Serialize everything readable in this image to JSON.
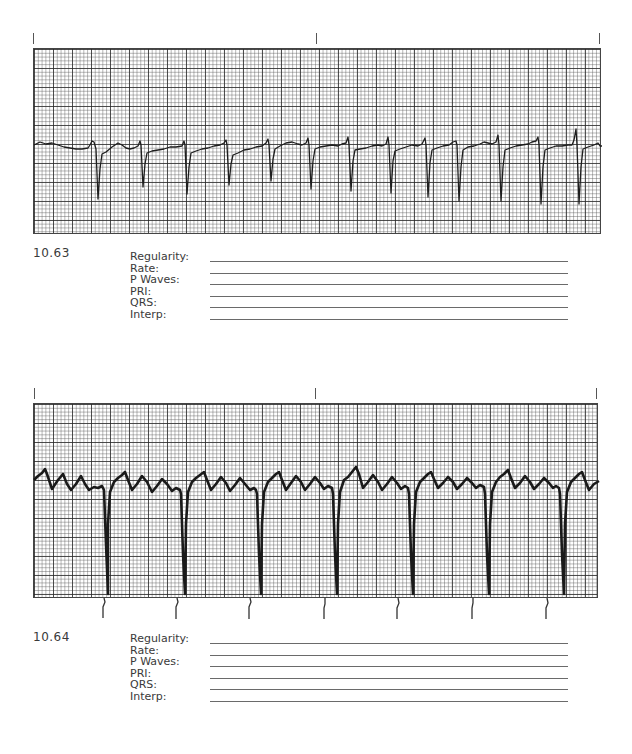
{
  "page": {
    "background": "#ffffff",
    "ink": "#3a3a3a"
  },
  "figures": [
    {
      "number": "10.63",
      "strip": {
        "description": "ECG rhythm strip on grid paper with negative (downward) QRS complexes",
        "top_ticks": 3,
        "qrs_count": 14
      },
      "fields": [
        {
          "label": "Regularity:",
          "value": ""
        },
        {
          "label": "Rate:",
          "value": ""
        },
        {
          "label": "P Waves:",
          "value": ""
        },
        {
          "label": "PRI:",
          "value": ""
        },
        {
          "label": "QRS:",
          "value": ""
        },
        {
          "label": "Interp:",
          "value": ""
        }
      ]
    },
    {
      "number": "10.64",
      "strip": {
        "description": "ECG rhythm strip with sawtooth flutter waves and regular deep negative QRS complexes, caliper marks below",
        "top_ticks": 3,
        "qrs_count": 7,
        "flutter_waves_per_qrs": 4
      },
      "fields": [
        {
          "label": "Regularity:",
          "value": ""
        },
        {
          "label": "Rate:",
          "value": ""
        },
        {
          "label": "P Waves:",
          "value": ""
        },
        {
          "label": "PRI:",
          "value": ""
        },
        {
          "label": "QRS:",
          "value": ""
        },
        {
          "label": "Interp:",
          "value": ""
        }
      ]
    }
  ]
}
